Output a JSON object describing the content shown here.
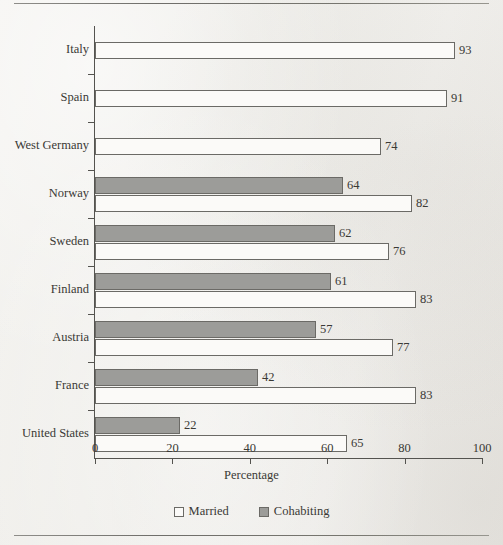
{
  "chart_data": {
    "type": "bar",
    "orientation": "horizontal",
    "title": "",
    "xlabel": "Percentage",
    "ylabel": "",
    "xlim": [
      0,
      100
    ],
    "xticks": [
      0,
      20,
      40,
      60,
      80,
      100
    ],
    "xtick_labels": [
      "0",
      "20",
      "40",
      "60",
      "80",
      "100"
    ],
    "grid": false,
    "legend_position": "bottom",
    "categories": [
      "Italy",
      "Spain",
      "West Germany",
      "Norway",
      "Sweden",
      "Finland",
      "Austria",
      "France",
      "United States"
    ],
    "series": [
      {
        "name": "Cohabiting",
        "color": "#9c9c99",
        "values": [
          null,
          null,
          null,
          64,
          62,
          61,
          57,
          42,
          22
        ],
        "value_labels": [
          "",
          "",
          "",
          "64",
          "62",
          "61",
          "57",
          "42",
          "22"
        ]
      },
      {
        "name": "Married",
        "color": "#fbfaf8",
        "values": [
          93,
          91,
          74,
          82,
          76,
          83,
          77,
          83,
          65
        ],
        "value_labels": [
          "93",
          "91",
          "74",
          "82",
          "76",
          "83",
          "77",
          "83",
          "65"
        ]
      }
    ]
  },
  "legend": {
    "items": [
      {
        "label": "Married",
        "swatch": "married"
      },
      {
        "label": "Cohabiting",
        "swatch": "cohabiting"
      }
    ]
  },
  "axis": {
    "x_title": "Percentage"
  }
}
